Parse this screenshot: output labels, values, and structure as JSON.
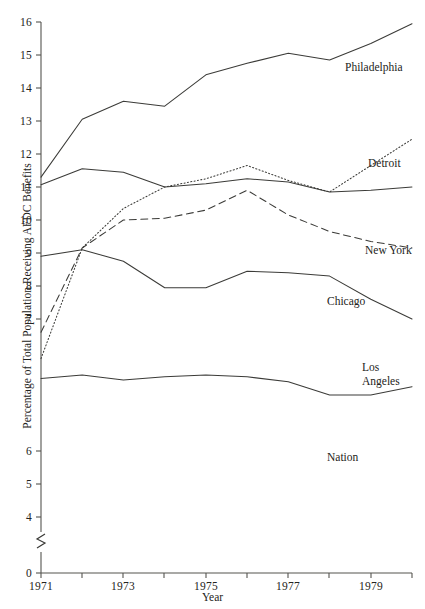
{
  "chart_data": {
    "type": "line",
    "title": "",
    "xlabel": "Year",
    "ylabel": "Percentage of Total Population Receiving AFDC Benefits",
    "x": [
      1971,
      1972,
      1973,
      1974,
      1975,
      1976,
      1977,
      1978,
      1979,
      1980
    ],
    "xlim": [
      1971,
      1980
    ],
    "ylim": [
      0,
      16
    ],
    "y_axis_break": "between 0 and 4",
    "y_ticks": [
      0,
      4,
      5,
      6,
      7,
      8,
      9,
      10,
      11,
      12,
      13,
      14,
      15,
      16
    ],
    "x_ticks": [
      1971,
      1972,
      1973,
      1974,
      1975,
      1976,
      1977,
      1978,
      1979,
      1980
    ],
    "x_tick_labels": [
      "1971",
      "",
      "1973",
      "",
      "1975",
      "",
      "1977",
      "",
      "1979",
      ""
    ],
    "grid": false,
    "legend_position": "inline-right-of-series",
    "series": [
      {
        "name": "Philadelphia",
        "style": "solid",
        "values": [
          11.3,
          13.05,
          13.6,
          13.45,
          14.4,
          14.75,
          15.05,
          14.85,
          15.35,
          15.95
        ],
        "label": "Philadelphia"
      },
      {
        "name": "Detroit",
        "style": "dotted",
        "values": [
          5.8,
          9.15,
          10.35,
          11.0,
          11.25,
          11.65,
          11.2,
          10.85,
          11.65,
          12.45
        ],
        "label": "Detroit"
      },
      {
        "name": "New York",
        "style": "solid",
        "values": [
          11.07,
          11.55,
          11.45,
          11.0,
          11.1,
          11.25,
          11.15,
          10.85,
          10.9,
          11.0
        ],
        "label": "New York"
      },
      {
        "name": "Chicago",
        "style": "dashed",
        "values": [
          6.6,
          9.15,
          10.0,
          10.05,
          10.3,
          10.9,
          10.15,
          9.65,
          9.35,
          9.15
        ],
        "label": "Chicago"
      },
      {
        "name": "Los Angeles",
        "style": "solid",
        "values": [
          8.9,
          9.1,
          8.75,
          7.95,
          7.95,
          8.45,
          8.4,
          8.3,
          7.6,
          7.0
        ],
        "label": "Los Angeles",
        "label_lines": [
          "Los",
          "Angeles"
        ]
      },
      {
        "name": "Nation",
        "style": "solid",
        "values": [
          5.2,
          5.3,
          5.15,
          5.25,
          5.3,
          5.25,
          5.1,
          4.7,
          4.7,
          4.95
        ],
        "label": "Nation"
      }
    ]
  },
  "axis": {
    "y_title": "Percentage of Total Population Receiving AFDC Benefits",
    "x_title": "Year",
    "y_tick_labels": [
      "16",
      "15",
      "14",
      "13",
      "12",
      "11",
      "10",
      "9",
      "8",
      "7",
      "6",
      "5",
      "4",
      "0"
    ],
    "x_tick_labels": [
      "1971",
      "1973",
      "1975",
      "1977",
      "1979"
    ]
  },
  "labels": {
    "philadelphia": "Philadelphia",
    "detroit": "Detroit",
    "new_york": "New York",
    "chicago": "Chicago",
    "los_angeles_line1": "Los",
    "los_angeles_line2": "Angeles",
    "nation": "Nation"
  },
  "colors": {
    "line": "#3b3b38",
    "axis": "#55544f",
    "text": "#232320",
    "background": "#ffffff"
  }
}
